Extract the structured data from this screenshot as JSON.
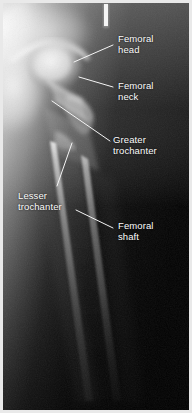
{
  "figure": {
    "modality": "X-ray",
    "view": "anteroposterior",
    "frame_color": "#e9e9e9",
    "background_color": "#050505",
    "label_color": "#fdfdfd",
    "leader_color": "#f5f5f5",
    "width": 192,
    "height": 413
  },
  "annotations": [
    {
      "id": "femoral-head",
      "label": "Femoral\nhead",
      "text_x": 118,
      "text_y": 33,
      "align": "left",
      "leader": {
        "x1": 113,
        "y1": 45,
        "x2": 74,
        "y2": 62
      }
    },
    {
      "id": "femoral-neck",
      "label": "Femoral\nneck",
      "text_x": 118,
      "text_y": 80,
      "align": "left",
      "leader": {
        "x1": 113,
        "y1": 87,
        "x2": 79,
        "y2": 77
      }
    },
    {
      "id": "greater-trochanter",
      "label": "Greater\ntrochanter",
      "text_x": 113,
      "text_y": 134,
      "align": "left",
      "leader": {
        "x1": 110,
        "y1": 141,
        "x2": 52,
        "y2": 101
      }
    },
    {
      "id": "lesser-trochanter",
      "label": "Lesser\ntrochanter",
      "text_x": 18,
      "text_y": 190,
      "align": "left",
      "leader": {
        "x1": 57,
        "y1": 186,
        "x2": 72,
        "y2": 143
      }
    },
    {
      "id": "femoral-shaft",
      "label": "Femoral\nshaft",
      "text_x": 118,
      "text_y": 220,
      "align": "left",
      "leader": {
        "x1": 113,
        "y1": 228,
        "x2": 76,
        "y2": 210
      }
    }
  ],
  "anatomy": {
    "structures": [
      "femoral head",
      "femoral neck",
      "greater trochanter",
      "lesser trochanter",
      "femoral shaft",
      "acetabulum",
      "pelvis"
    ]
  },
  "markers": [
    {
      "id": "side-marker",
      "x": 104,
      "y": 4,
      "width": 4,
      "height": 22
    }
  ]
}
